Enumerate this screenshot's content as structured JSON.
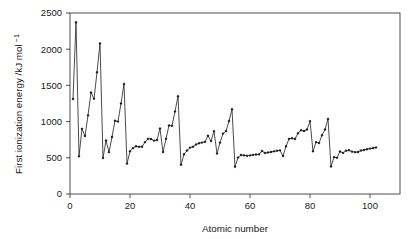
{
  "chart_data": {
    "type": "line",
    "title": "",
    "xlabel": "Atomic number",
    "ylabel": "First ionization energy /kJ mol −1",
    "ylabel_main": "First ionization energy /kJ mol",
    "ylabel_exponent": "−1",
    "xlim": [
      0,
      110
    ],
    "ylim": [
      0,
      2500
    ],
    "xticks": [
      0,
      20,
      40,
      60,
      80,
      100
    ],
    "yticks": [
      0,
      500,
      1000,
      1500,
      2000,
      2500
    ],
    "xticklabels": [
      "0",
      "20",
      "40",
      "60",
      "80",
      "100"
    ],
    "yticklabels": [
      "0",
      "500",
      "1000",
      "1500",
      "2000",
      "2500"
    ],
    "grid": false,
    "legend": "none",
    "marker": "filled-diamond",
    "line_color": "#2b2b2b",
    "marker_color": "#1a1a1a",
    "background_color": "#ffffff",
    "frame": "box",
    "series": [
      {
        "name": "First ionization energy",
        "x": [
          1,
          2,
          3,
          4,
          5,
          6,
          7,
          8,
          9,
          10,
          11,
          12,
          13,
          14,
          15,
          16,
          17,
          18,
          19,
          20,
          21,
          22,
          23,
          24,
          25,
          26,
          27,
          28,
          29,
          30,
          31,
          32,
          33,
          34,
          35,
          36,
          37,
          38,
          39,
          40,
          41,
          42,
          43,
          44,
          45,
          46,
          47,
          48,
          49,
          50,
          51,
          52,
          53,
          54,
          55,
          56,
          57,
          58,
          59,
          60,
          61,
          62,
          63,
          64,
          65,
          66,
          67,
          68,
          69,
          70,
          71,
          72,
          73,
          74,
          75,
          76,
          77,
          78,
          79,
          80,
          81,
          82,
          83,
          84,
          85,
          86,
          87,
          88,
          89,
          90,
          91,
          92,
          93,
          94,
          95,
          96,
          97,
          98,
          99,
          100,
          101,
          102
        ],
        "values": [
          1312,
          2372,
          520,
          900,
          801,
          1086,
          1402,
          1314,
          1681,
          2081,
          496,
          738,
          578,
          787,
          1012,
          1000,
          1251,
          1521,
          419,
          590,
          633,
          659,
          651,
          653,
          717,
          762,
          760,
          737,
          745,
          906,
          579,
          762,
          947,
          941,
          1140,
          1351,
          403,
          549,
          600,
          640,
          652,
          684,
          702,
          710,
          720,
          804,
          731,
          868,
          558,
          709,
          834,
          869,
          1008,
          1170,
          376,
          503,
          538,
          534,
          527,
          533,
          540,
          545,
          547,
          593,
          566,
          573,
          581,
          589,
          597,
          603,
          524,
          659,
          761,
          770,
          760,
          840,
          880,
          870,
          890,
          1007,
          589,
          716,
          703,
          812,
          890,
          1037,
          380,
          509,
          499,
          587,
          568,
          598,
          605,
          585,
          578,
          581,
          601,
          608,
          619,
          627,
          635,
          642
        ]
      }
    ]
  }
}
